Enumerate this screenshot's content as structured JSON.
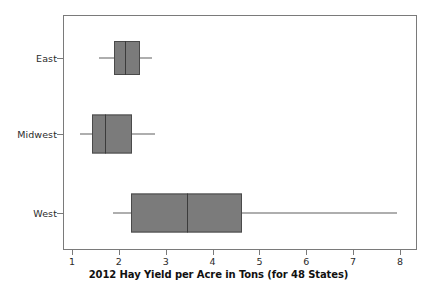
{
  "chart_data": {
    "type": "box",
    "title": "2012 Hay Yield per Acre in Tons (for 48 States)",
    "xlabel": "2012 Hay Yield per Acre in Tons (for 48 States)",
    "ylabel": "",
    "orientation": "horizontal",
    "xlim": [
      0.72,
      8.07
    ],
    "xticks": [
      1,
      2,
      3,
      4,
      5,
      6,
      7,
      8
    ],
    "xtick_labels": [
      "1",
      "2",
      "3",
      "4",
      "5",
      "6",
      "7",
      "8"
    ],
    "grid": false,
    "legend": false,
    "categories": [
      "East",
      "Midwest",
      "West"
    ],
    "boxes": [
      {
        "name": "East",
        "min": 1.58,
        "q1": 1.9,
        "median": 2.13,
        "q3": 2.45,
        "max": 2.71
      },
      {
        "name": "Midwest",
        "min": 1.17,
        "q1": 1.43,
        "median": 1.7,
        "q3": 2.28,
        "max": 2.77
      },
      {
        "name": "West",
        "min": 1.87,
        "q1": 2.26,
        "median": 3.45,
        "q3": 4.62,
        "max": 7.93
      }
    ],
    "colors": {
      "box_fill": "#7b7b7b",
      "box_edge": "#4a4a4a",
      "median": "#3b3b3b",
      "whisker": "#5e5e5e",
      "frame": "#7a7a7a",
      "text": "#2b2b2b",
      "background": "#ffffff"
    }
  },
  "axis": {
    "tick_labels": [
      "1",
      "2",
      "3",
      "4",
      "5",
      "6",
      "7",
      "8"
    ],
    "category_labels": [
      "East",
      "Midwest",
      "West"
    ],
    "title": "2012 Hay Yield per Acre in Tons (for 48 States)"
  }
}
